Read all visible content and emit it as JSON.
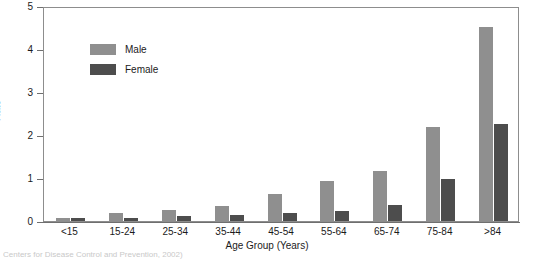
{
  "chart_data": {
    "type": "bar",
    "title": "",
    "xlabel": "Age Group (Years)",
    "ylabel": "Rate",
    "categories": [
      "<15",
      "15-24",
      "25-34",
      "35-44",
      "45-54",
      "55-64",
      "65-74",
      "75-84",
      ">84"
    ],
    "series": [
      {
        "name": "Male",
        "color": "#8f8f8f",
        "values": [
          0.08,
          0.18,
          0.25,
          0.36,
          0.62,
          0.93,
          1.16,
          2.19,
          4.52
        ]
      },
      {
        "name": "Female",
        "color": "#4d4d4d",
        "values": [
          0.08,
          0.08,
          0.11,
          0.14,
          0.18,
          0.24,
          0.38,
          0.98,
          2.26
        ]
      }
    ],
    "ylim": [
      0,
      5
    ],
    "yticks": [
      "0",
      "1",
      "2",
      "3",
      "4",
      "5"
    ],
    "ytick_values": [
      0,
      1,
      2,
      3,
      4,
      5
    ],
    "grid": false,
    "legend_position": "top-left",
    "legend": [
      "Male",
      "Female"
    ]
  },
  "footnote": "Centers for Disease Control and Prevention, 2002)"
}
